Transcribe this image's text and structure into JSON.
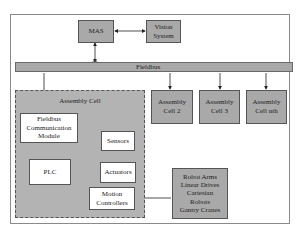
{
  "diagram": {
    "nodes": {
      "mas": "MAS",
      "vision": [
        "Vision",
        "System"
      ],
      "fieldbus": "Fieldbus",
      "assembly_cell": "Assembly Cell",
      "fcm": [
        "Fieldbus",
        "Communication",
        "Module"
      ],
      "plc": "PLC",
      "sensors": "Sensors",
      "actuators": "Actuators",
      "motion": [
        "Motion",
        "Controllers"
      ],
      "cell2": [
        "Assembly",
        "Cell 2"
      ],
      "cell3": [
        "Assembly",
        "Cell 3"
      ],
      "celln": [
        "Assembly",
        "Cell nth"
      ],
      "devices": [
        "Robot Arms",
        "Linear Drives",
        "Cartesian",
        "Robots",
        "Gantry Cranes"
      ]
    },
    "edges": [
      {
        "from": "MAS",
        "to": "Vision System",
        "type": "bidirectional"
      },
      {
        "from": "MAS",
        "to": "Fieldbus",
        "type": "bidirectional"
      },
      {
        "from": "Fieldbus",
        "to": "Fieldbus Communication Module",
        "type": "directed"
      },
      {
        "from": "Fieldbus",
        "to": "Assembly Cell 2",
        "type": "directed"
      },
      {
        "from": "Fieldbus",
        "to": "Assembly Cell 3",
        "type": "directed"
      },
      {
        "from": "Fieldbus",
        "to": "Assembly Cell nth",
        "type": "directed"
      },
      {
        "from": "Fieldbus Communication Module",
        "to": "PLC",
        "type": "bidirectional"
      },
      {
        "from": "Sensors",
        "to": "PLC",
        "type": "directed"
      },
      {
        "from": "PLC",
        "to": "Actuators",
        "type": "directed"
      },
      {
        "from": "PLC",
        "to": "Motion Controllers",
        "type": "bidirectional"
      },
      {
        "from": "Robot Arms / Linear Drives / Cartesian Robots / Gantry Cranes",
        "to": "Motion Controllers",
        "type": "directed"
      }
    ]
  }
}
